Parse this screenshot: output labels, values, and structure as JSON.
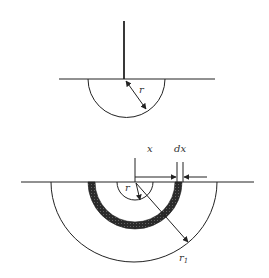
{
  "figures": {
    "top": {
      "description": "Vertical conductor meeting a ground plane with a hemispherical region of radius r",
      "labels": {
        "radius": "r"
      }
    },
    "bottom": {
      "description": "Hemispherical shell of thickness dx at distance x, between radius r and r1",
      "labels": {
        "distance": "x",
        "thickness": "dx",
        "inner_radius": "r",
        "outer_radius": "r",
        "outer_radius_subscript": "1"
      }
    }
  },
  "colors": {
    "line": "#222222",
    "shell_fill": "#2a2a2a",
    "background": "#ffffff"
  }
}
